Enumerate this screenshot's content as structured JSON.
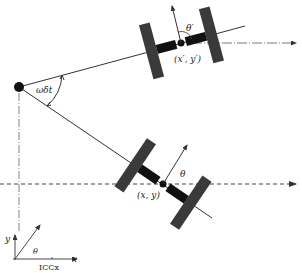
{
  "diagram": {
    "colors": {
      "line": "#333333",
      "wheel": "#3a3a3a",
      "axle": "#111111",
      "background": "#ffffff"
    },
    "labels": {
      "angle_omega_dt": "ωδt",
      "theta_prime": "θ′",
      "pose_prime": "(x′, y′)",
      "theta": "θ",
      "pose": "(x, y)",
      "axis_y": "y",
      "axis_x": "x",
      "axis_theta": "θ",
      "icc_x": "ICCx"
    },
    "nodes": [
      {
        "id": "icc",
        "label": "ICC"
      },
      {
        "id": "robot_after",
        "label": "(x′, y′)"
      },
      {
        "id": "robot_before",
        "label": "(x, y)"
      }
    ],
    "edges": [
      {
        "from": "icc",
        "to": "robot_after",
        "label": "radius R"
      },
      {
        "from": "icc",
        "to": "robot_before",
        "label": "radius R"
      }
    ]
  }
}
